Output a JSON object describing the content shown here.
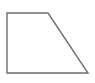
{
  "figure": {
    "name": "right-trapezoid",
    "background_color": "#ffffff",
    "stroke_color": "#6e6e6e",
    "fill_color": "none",
    "stroke_width": 1.4,
    "canvas": {
      "width": 95,
      "height": 83
    },
    "vertices": [
      {
        "label": "top-left",
        "x": 7,
        "y": 13
      },
      {
        "label": "top-right",
        "x": 48,
        "y": 13
      },
      {
        "label": "bottom-right",
        "x": 88,
        "y": 73
      },
      {
        "label": "bottom-left",
        "x": 7,
        "y": 73
      }
    ],
    "points_attr": "7,13 48,13 88,73 7,73",
    "edges": [
      {
        "name": "top-edge",
        "from": "top-left",
        "to": "top-right",
        "orientation": "horizontal"
      },
      {
        "name": "slanted-edge",
        "from": "top-right",
        "to": "bottom-right",
        "orientation": "diagonal"
      },
      {
        "name": "bottom-edge",
        "from": "bottom-right",
        "to": "bottom-left",
        "orientation": "horizontal"
      },
      {
        "name": "left-edge",
        "from": "bottom-left",
        "to": "top-left",
        "orientation": "vertical"
      }
    ]
  }
}
